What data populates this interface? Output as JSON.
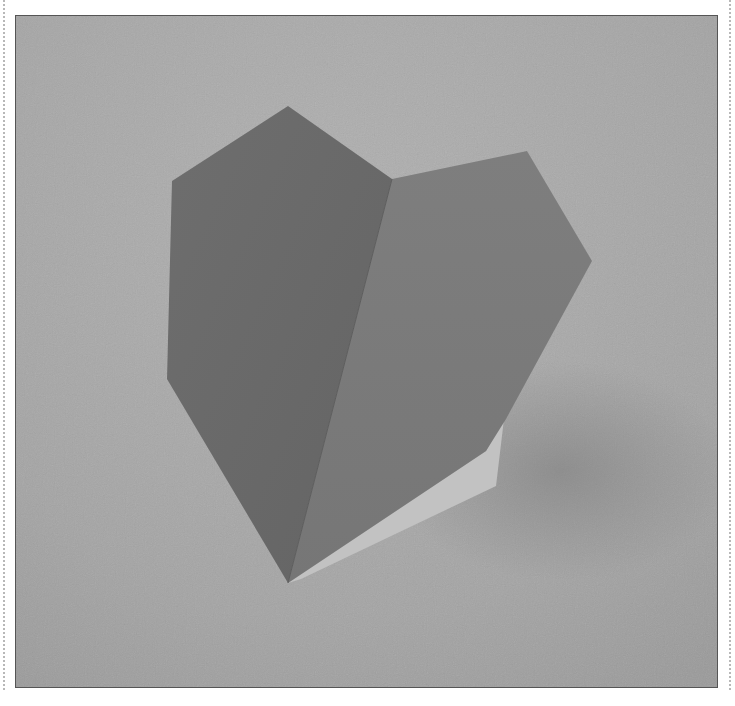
{
  "image": {
    "subject": "folded paper origami heart standing on textured paper background",
    "colors": {
      "background": "#a6a6a6",
      "background_light": "#b0b0b0",
      "background_shadow": "#8e8e8e",
      "left_face": "#6b6b6b",
      "right_face": "#7d7d7d",
      "inner_flap": "#c4c4c4",
      "frame_border": "#555555",
      "dotted_guide": "#b8b8b8"
    }
  }
}
